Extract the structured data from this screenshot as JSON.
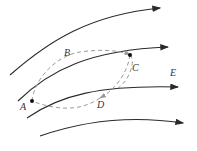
{
  "diagram": {
    "field_label": "E",
    "points": {
      "A": "A",
      "B": "B",
      "C": "C",
      "D": "D"
    },
    "colors": {
      "field_line": "#2a2a2a",
      "path": "#9a9a9a",
      "point": "#111111"
    }
  }
}
